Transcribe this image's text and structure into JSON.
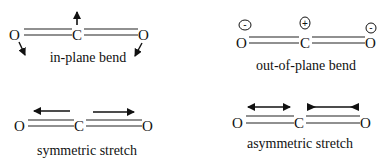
{
  "diagram": {
    "panels": [
      {
        "id": "in-plane-bend",
        "label": "in-plane bend",
        "atoms": [
          "O",
          "C",
          "O"
        ],
        "motion": "C moves up, both O atoms move down-outward (arrows)"
      },
      {
        "id": "out-of-plane-bend",
        "label": "out-of-plane bend",
        "atoms": [
          "O",
          "C",
          "O"
        ],
        "charges": [
          "-",
          "+",
          "-"
        ],
        "motion": "C out of plane (+), O atoms into plane (-)"
      },
      {
        "id": "symmetric-stretch",
        "label": "symmetric stretch",
        "atoms": [
          "O",
          "C",
          "O"
        ],
        "motion": "left arrow points left, right arrow points right"
      },
      {
        "id": "asymmetric-stretch",
        "label": "asymmetric stretch",
        "atoms": [
          "O",
          "C",
          "O"
        ],
        "motion": "double-headed arrow over left bond, converging arrow over right bond"
      }
    ]
  }
}
